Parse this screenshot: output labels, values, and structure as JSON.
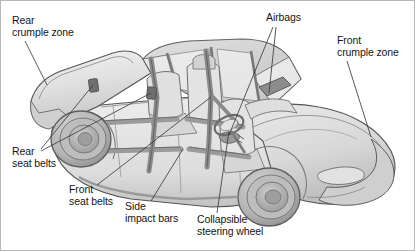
{
  "figure": {
    "view": "rear three-quarter isometric cutaway, car facing right",
    "background_color": "#ffffff",
    "border_color": "#b8b8b8",
    "text_color": "#151515"
  },
  "labels": [
    {
      "id": "rear-crumple-zone",
      "line1": "Rear",
      "line2": "crumple zone",
      "position": "top-left",
      "leader_count": 1
    },
    {
      "id": "airbags",
      "line1": "Airbags",
      "line2": "",
      "position": "top-center-right",
      "leader_count": 2
    },
    {
      "id": "front-crumple-zone",
      "line1": "Front",
      "line2": "crumple zone",
      "position": "top-right",
      "leader_count": 1
    },
    {
      "id": "rear-seat-belts",
      "line1": "Rear",
      "line2": "seat belts",
      "position": "left",
      "leader_count": 2
    },
    {
      "id": "front-seat-belts",
      "line1": "Front",
      "line2": "seat belts",
      "position": "bottom-left",
      "leader_count": 1
    },
    {
      "id": "side-impact-bars",
      "line1": "Side",
      "line2": "impact bars",
      "position": "bottom-center-left",
      "leader_count": 1
    },
    {
      "id": "collapsible-steering-wheel",
      "line1": "Collapsible",
      "line2": "steering wheel",
      "position": "bottom-center",
      "leader_count": 1
    }
  ],
  "colors": {
    "body_light": "#e9e9e9",
    "body_mid": "#d4d4d4",
    "body_dark": "#b6b6b6",
    "body_shadow": "#9d9d9d",
    "glass": "#efefef",
    "outline": "#4a4a4a",
    "outline_soft": "#7a7a7a",
    "belt": "#8d8d8d",
    "belt_dark": "#6f6f6f",
    "bar": "#9a9a9a",
    "tire": "#c7c7c7",
    "tire_dark": "#8e8e8e",
    "hub": "#ababab",
    "leader": "#3c3c3c"
  }
}
